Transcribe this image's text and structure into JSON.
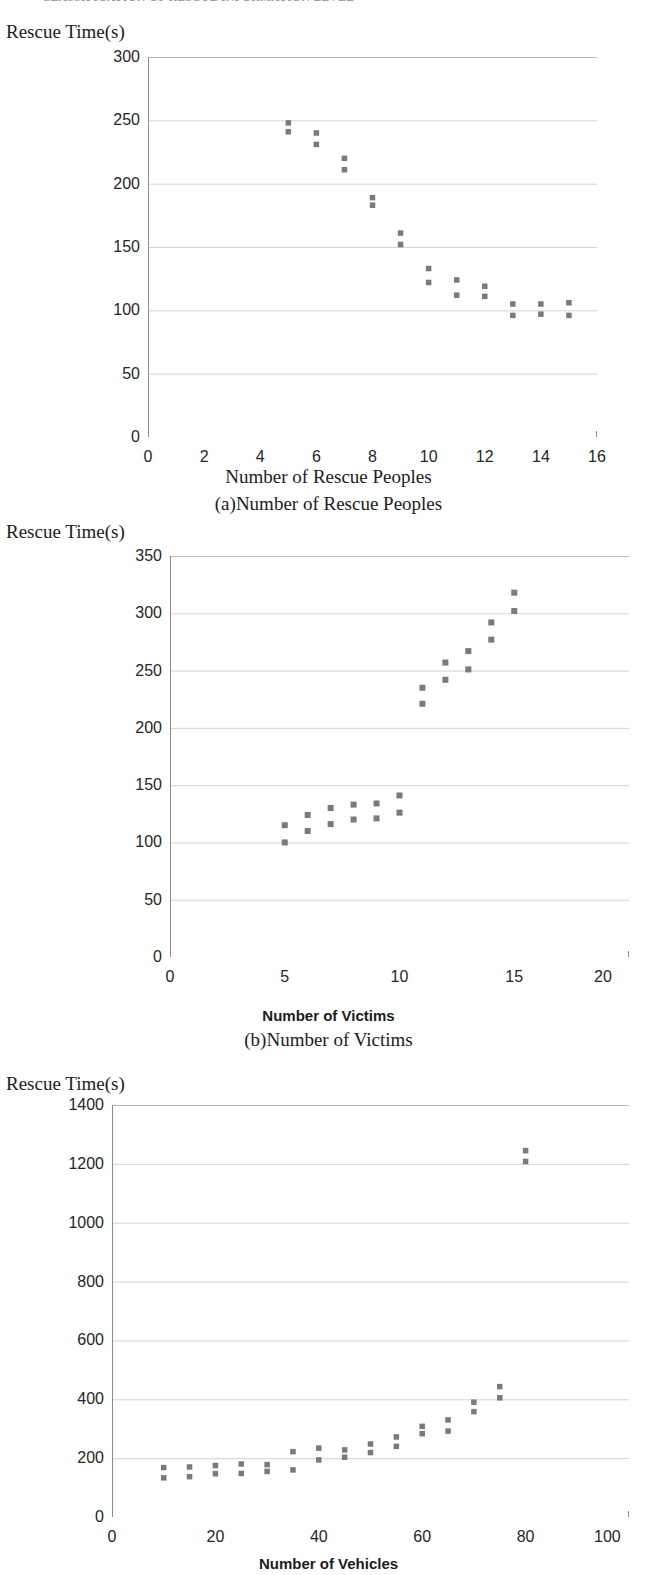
{
  "running_header": {
    "text": "CLASSIFICATION OF RESCUE INFORMATION LEVEL"
  },
  "figures": [
    {
      "id": "fig-a",
      "caption": "(a)Number of Rescue Peoples",
      "ylabel": "Rescue Time(s)",
      "xaxis_title": "Number of Rescue Peoples",
      "xaxis_title_style": "serif",
      "xtick_clip": false,
      "chart": {
        "type": "scatter",
        "title": "",
        "xlabel": "Number of Rescue Peoples",
        "ylabel": "Rescue Time(s)",
        "xlim": [
          0,
          16
        ],
        "ylim": [
          0,
          300
        ],
        "xticks": [
          0,
          2,
          4,
          6,
          8,
          10,
          12,
          14,
          16
        ],
        "yticks": [
          0,
          50,
          100,
          150,
          200,
          250,
          300
        ],
        "grid": true,
        "legend": "none",
        "marker_color": "#7a7a7a",
        "points": [
          [
            5,
            248
          ],
          [
            5,
            241
          ],
          [
            6,
            240
          ],
          [
            6,
            231
          ],
          [
            7,
            220
          ],
          [
            7,
            211
          ],
          [
            8,
            189
          ],
          [
            8,
            183
          ],
          [
            9,
            161
          ],
          [
            9,
            152
          ],
          [
            10,
            133
          ],
          [
            10,
            122
          ],
          [
            11,
            124
          ],
          [
            11,
            112
          ],
          [
            12,
            119
          ],
          [
            12,
            111
          ],
          [
            13,
            105
          ],
          [
            13,
            96
          ],
          [
            14,
            105
          ],
          [
            14,
            97
          ],
          [
            15,
            106
          ],
          [
            15,
            96
          ]
        ]
      }
    },
    {
      "id": "fig-b",
      "caption": "(b)Number of Victims",
      "ylabel": "Rescue Time(s)",
      "xaxis_title": "Number of Victims",
      "xaxis_title_style": "sans-bold",
      "xtick_clip": true,
      "chart": {
        "type": "scatter",
        "title": "",
        "xlabel": "Number of Victims",
        "ylabel": "Rescue Time(s)",
        "xlim": [
          0,
          20
        ],
        "ylim": [
          0,
          350
        ],
        "xticks": [
          0,
          5,
          10,
          15,
          20
        ],
        "yticks": [
          0,
          50,
          100,
          150,
          200,
          250,
          300,
          350
        ],
        "grid": true,
        "legend": "none",
        "marker_color": "#7a7a7a",
        "points": [
          [
            5,
            115
          ],
          [
            5,
            100
          ],
          [
            6,
            124
          ],
          [
            6,
            110
          ],
          [
            7,
            130
          ],
          [
            7,
            116
          ],
          [
            8,
            133
          ],
          [
            8,
            120
          ],
          [
            9,
            134
          ],
          [
            9,
            121
          ],
          [
            10,
            141
          ],
          [
            10,
            126
          ],
          [
            11,
            235
          ],
          [
            11,
            221
          ],
          [
            12,
            257
          ],
          [
            12,
            242
          ],
          [
            13,
            267
          ],
          [
            13,
            251
          ],
          [
            14,
            292
          ],
          [
            14,
            277
          ],
          [
            15,
            318
          ],
          [
            15,
            302
          ]
        ]
      }
    },
    {
      "id": "fig-c",
      "caption": "",
      "ylabel": "Rescue Time(s)",
      "xaxis_title": "Number of Vehicles",
      "xaxis_title_style": "sans-bold",
      "xtick_clip": true,
      "chart": {
        "type": "scatter",
        "title": "",
        "xlabel": "Number of Vehicles",
        "ylabel": "Rescue Time(s)",
        "xlim": [
          0,
          100
        ],
        "ylim": [
          0,
          1400
        ],
        "xticks": [
          0,
          20,
          40,
          60,
          80,
          100
        ],
        "yticks": [
          0,
          200,
          400,
          600,
          800,
          1000,
          1200,
          1400
        ],
        "grid": true,
        "legend": "none",
        "marker_color": "#7a7a7a",
        "points": [
          [
            10,
            168
          ],
          [
            10,
            133
          ],
          [
            15,
            170
          ],
          [
            15,
            137
          ],
          [
            20,
            175
          ],
          [
            20,
            147
          ],
          [
            25,
            180
          ],
          [
            25,
            148
          ],
          [
            30,
            178
          ],
          [
            30,
            155
          ],
          [
            35,
            222
          ],
          [
            35,
            160
          ],
          [
            40,
            234
          ],
          [
            40,
            194
          ],
          [
            45,
            228
          ],
          [
            45,
            203
          ],
          [
            50,
            248
          ],
          [
            50,
            219
          ],
          [
            55,
            272
          ],
          [
            55,
            240
          ],
          [
            60,
            308
          ],
          [
            60,
            283
          ],
          [
            65,
            330
          ],
          [
            65,
            292
          ],
          [
            70,
            390
          ],
          [
            70,
            358
          ],
          [
            75,
            443
          ],
          [
            75,
            405
          ],
          [
            80,
            1245
          ],
          [
            80,
            1208
          ]
        ]
      }
    }
  ],
  "axis_label_clips": {
    "fig-b-last": "20",
    "fig-c-last": "100"
  }
}
